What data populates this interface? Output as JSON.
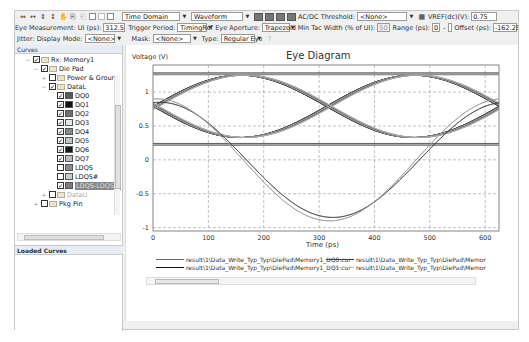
{
  "toolbar1": {
    "icons": [
      "zoom-in-x-icon",
      "zoom-out-x-icon",
      "zoom-in-y-icon",
      "zoom-out-y-icon",
      "pan-icon",
      "copy-icon",
      "paste-icon",
      "checkbox-1-icon",
      "checkbox-2-icon",
      "checkbox-3-icon"
    ],
    "domain_select": "Time Domain",
    "view_select": "Waveform",
    "grid_buttons": [
      "grid-layout-1",
      "grid-layout-2",
      "grid-layout-3",
      "grid-layout-4"
    ],
    "acdc_label": "AC/DC Threshold:",
    "acdc_value": "<None>",
    "vref_label": "VREF(dc)(V):",
    "vref_value": "0.75"
  },
  "toolbar2": {
    "eye_measurement_label": "Eye Measurement:",
    "ui_label": "UI (ps):",
    "ui_value": "312.5",
    "trigger_label": "Trigger Period:",
    "trigger_value": "TimingRef",
    "aperture_label": "Eye Aperture:",
    "aperture_value": "Trapezoid",
    "min_tac_label": "Min Tac Width (% of UI):",
    "min_tac_value": "50",
    "range_label": "Range (ps):",
    "range_from": "0",
    "range_to": "",
    "offset_label": "Offset (ps):",
    "offset_value": "-162.25",
    "hash_label": "#"
  },
  "toolbar3": {
    "jitter_label": "Jitter: Display Mode:",
    "jitter_value": "<None>",
    "mask_label": "Mask:",
    "mask_value": "<None>",
    "type_label": "Type:",
    "type_value": "Regular Eye"
  },
  "curves_panel": {
    "header": "Curves",
    "items": [
      {
        "label": "Rx: Memory1",
        "level": 0,
        "checked": true,
        "kind": "folder",
        "expanded": true
      },
      {
        "label": "Die Pad",
        "level": 1,
        "checked": true,
        "kind": "folder",
        "expanded": true
      },
      {
        "label": "Power & Grour",
        "level": 2,
        "checked": false,
        "kind": "folder",
        "expanded": false
      },
      {
        "label": "DataL",
        "level": 2,
        "checked": true,
        "kind": "folder",
        "expanded": true
      },
      {
        "label": "DQ0",
        "level": 3,
        "checked": true,
        "color": "#5a5a5a"
      },
      {
        "label": "DQ1",
        "level": 3,
        "checked": true,
        "color": "#111111"
      },
      {
        "label": "DQ2",
        "level": 3,
        "checked": true,
        "color": "#6e6e6e"
      },
      {
        "label": "DQ3",
        "level": 3,
        "checked": true,
        "color": "#e6e6e6"
      },
      {
        "label": "DQ4",
        "level": 3,
        "checked": true,
        "color": "#8a8a8a"
      },
      {
        "label": "DQ5",
        "level": 3,
        "checked": true,
        "color": "#c4c4c4"
      },
      {
        "label": "DQ6",
        "level": 3,
        "checked": true,
        "color": "#1a1a1a"
      },
      {
        "label": "DQ7",
        "level": 3,
        "checked": true,
        "color": "#bdbdbd"
      },
      {
        "label": "LDQS",
        "level": 3,
        "checked": false,
        "color": "#8a8a8a"
      },
      {
        "label": "LDQS#",
        "level": 3,
        "checked": false,
        "color": "#cccccc"
      },
      {
        "label": "LDQS-LDQS#",
        "level": 3,
        "checked": true,
        "color": "#7a7a7a",
        "selected": true
      },
      {
        "label": "DataU",
        "level": 2,
        "checked": false,
        "kind": "folder",
        "expanded": false,
        "dim": true
      },
      {
        "label": "Pkg Pin",
        "level": 1,
        "checked": false,
        "kind": "folder",
        "expanded": false
      }
    ]
  },
  "loaded_panel": {
    "header": "Loaded Curves"
  },
  "legend": [
    {
      "label": "result\\1\\Data_Write_Typ_Typ\\DiePad\\Memory1_DQ0.cur",
      "color": "#666666"
    },
    {
      "label": "result\\1\\Data_Write_Typ_Typ\\DiePad\\Memory1_DQ1.cur",
      "color": "#111111"
    },
    {
      "label": "result\\1\\Data_Write_Typ_Typ\\DiePad\\Memor",
      "color": "#444444"
    },
    {
      "label": "result\\1\\Data_Write_Typ_Typ\\DiePad\\Memor",
      "color": "#bbbbbb"
    }
  ],
  "chart_data": {
    "type": "line",
    "title": "Eye Diagram",
    "xlabel": "Time (ps)",
    "ylabel": "Voltage (V)",
    "xlim": [
      0,
      625
    ],
    "ylim": [
      -1.05,
      1.4
    ],
    "xticks": [
      0,
      100,
      200,
      300,
      400,
      500,
      600
    ],
    "yticks": [
      -1,
      -0.5,
      0,
      0.5,
      1
    ],
    "grid": true,
    "legend_position": "bottom",
    "series": [
      {
        "name": "DQ data eye (rising)",
        "x": [
          0,
          100,
          162,
          250,
          312,
          400,
          475,
          562,
          625
        ],
        "values": [
          0.8,
          1.1,
          1.25,
          1.0,
          0.78,
          0.5,
          0.35,
          0.55,
          0.8
        ]
      },
      {
        "name": "DQ data eye (falling)",
        "x": [
          0,
          100,
          162,
          250,
          312,
          400,
          475,
          562,
          625
        ],
        "values": [
          0.72,
          0.4,
          0.33,
          0.55,
          0.78,
          1.05,
          1.25,
          1.0,
          0.75
        ]
      },
      {
        "name": "DQ high rail",
        "x": [
          0,
          625
        ],
        "values": [
          1.27,
          1.27
        ]
      },
      {
        "name": "DQ low rail",
        "x": [
          0,
          625
        ],
        "values": [
          0.23,
          0.23
        ]
      },
      {
        "name": "LDQS-LDQS# (diff strobe) A",
        "x": [
          0,
          100,
          162,
          250,
          325,
          400,
          475,
          550,
          625
        ],
        "values": [
          -0.85,
          -0.5,
          0.0,
          0.55,
          0.85,
          0.5,
          0.0,
          -0.55,
          -0.85
        ]
      },
      {
        "name": "LDQS-LDQS# (diff strobe) B",
        "x": [
          0,
          100,
          162,
          250,
          325,
          400,
          475,
          550,
          625
        ],
        "values": [
          0.9,
          0.5,
          0.0,
          -0.55,
          -0.88,
          -0.5,
          0.0,
          0.55,
          0.88
        ]
      }
    ]
  },
  "chart_labels": {
    "title": "Eye Diagram",
    "ylabel": "Voltage (V)",
    "xlabel": "Time (ps)",
    "yticks": [
      "1",
      "0.5",
      "0",
      "-0.5",
      "-1"
    ],
    "xticks": [
      "0",
      "100",
      "200",
      "300",
      "400",
      "500",
      "600"
    ]
  }
}
